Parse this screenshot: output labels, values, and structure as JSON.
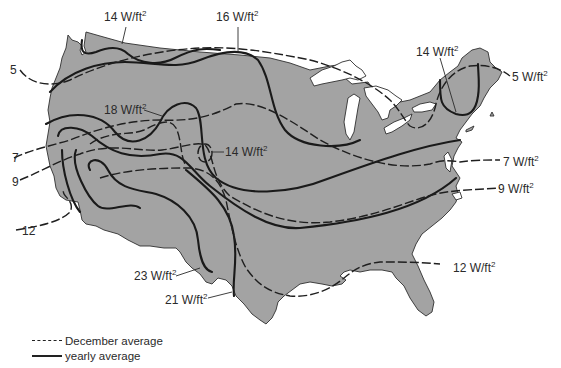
{
  "map": {
    "subject": "Contiguous United States solar insolation contours",
    "land_color": "#a3a3a3",
    "line_color": "#1a1a1a",
    "contours": [
      {
        "id": "nw-14",
        "type": "yearly",
        "label": "14 W/ft",
        "exp": "2"
      },
      {
        "id": "n-16",
        "type": "yearly",
        "label": "16 W/ft",
        "exp": "2"
      },
      {
        "id": "ne-14",
        "type": "yearly",
        "label": "14 W/ft",
        "exp": "2"
      },
      {
        "id": "dec-5-w",
        "type": "december",
        "label": "5"
      },
      {
        "id": "dec-5-e",
        "type": "december",
        "label": "5 W/ft",
        "exp": "2"
      },
      {
        "id": "yr-18",
        "type": "yearly",
        "label": "18 W/ft",
        "exp": "2"
      },
      {
        "id": "c-14",
        "type": "december",
        "label": "14 W/ft",
        "exp": "2"
      },
      {
        "id": "dec-7-w",
        "type": "december",
        "label": "7"
      },
      {
        "id": "dec-7-e",
        "type": "december",
        "label": "7 W/ft",
        "exp": "2"
      },
      {
        "id": "dec-9-w",
        "type": "december",
        "label": "9"
      },
      {
        "id": "dec-9-e",
        "type": "december",
        "label": "9 W/ft",
        "exp": "2"
      },
      {
        "id": "dec-12-w",
        "type": "december",
        "label": "12"
      },
      {
        "id": "dec-12-e",
        "type": "december",
        "label": "12 W/ft",
        "exp": "2"
      },
      {
        "id": "yr-23",
        "type": "yearly",
        "label": "23 W/ft",
        "exp": "2"
      },
      {
        "id": "yr-21",
        "type": "yearly",
        "label": "21 W/ft",
        "exp": "2"
      }
    ]
  },
  "legend": {
    "december": "December average",
    "yearly": "yearly average"
  }
}
